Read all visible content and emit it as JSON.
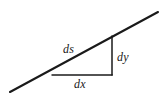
{
  "figure": {
    "kind": "geometry-diagram",
    "background_color": "#ffffff",
    "stroke_color": "#1a1a1a",
    "text_color": "#1a1a1a",
    "canvas": {
      "width": 167,
      "height": 103
    },
    "labels": {
      "hypotenuse": "ds",
      "vertical_leg": "dy",
      "horizontal_leg": "dx"
    },
    "geometry": {
      "line": {
        "name": "secant-line",
        "x1": 10,
        "y1": 92,
        "x2": 158,
        "y2": 12,
        "stroke_width": 2.1
      },
      "vertical_leg": {
        "name": "dy-leg",
        "x1": 112,
        "y1": 36,
        "x2": 112,
        "y2": 75,
        "stroke_width": 1.5
      },
      "horizontal_leg": {
        "name": "dx-leg",
        "x1": 52,
        "y1": 75,
        "x2": 112.6,
        "y2": 75,
        "stroke_width": 1.5
      },
      "vertices": {
        "left": {
          "x": 52,
          "y": 75
        },
        "corner": {
          "x": 112,
          "y": 75
        },
        "top": {
          "x": 112,
          "y": 36
        }
      }
    }
  }
}
